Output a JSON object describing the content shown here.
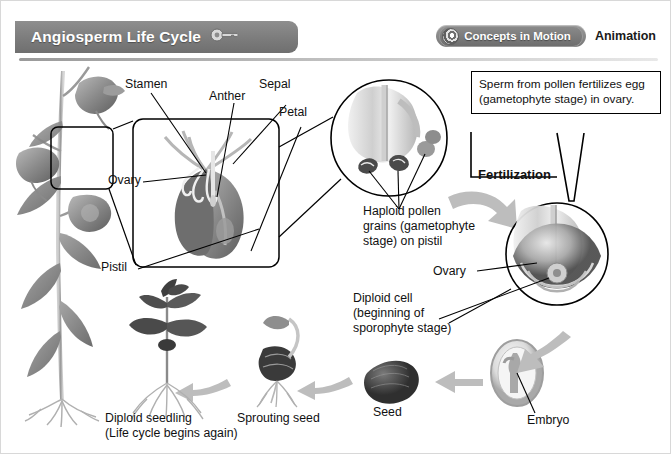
{
  "header": {
    "title": "Angiosperm Life Cycle",
    "key_icon": "key-icon",
    "concepts_badge": "Concepts in Motion",
    "animation_label": "Animation",
    "badge_icon": "motion-globe-icon"
  },
  "flower_labels": {
    "stamen": "Stamen",
    "anther": "Anther",
    "sepal": "Sepal",
    "petal": "Petal",
    "ovary": "Ovary",
    "pistil": "Pistil"
  },
  "callouts": {
    "pollen": "Haploid pollen\ngrains (gametophyte\nstage) on pistil",
    "sperm_box": "Sperm from pollen fertilizes\negg (gametophyte stage) in\novary.",
    "diploid_cell": "Diploid cell\n(beginning of\nsporophyte stage)"
  },
  "stage_labels": {
    "fertilization": "Fertilization",
    "ovary_detail": "Ovary",
    "embryo": "Embryo",
    "seed": "Seed",
    "sprouting_seed": "Sprouting seed",
    "seedling": "Diploid seedling\n(Life cycle begins again)"
  },
  "colors": {
    "banner_gray": "#7c7c7c",
    "arrow_gray": "#b3b3b3",
    "line_black": "#000000",
    "page_white": "#ffffff"
  }
}
